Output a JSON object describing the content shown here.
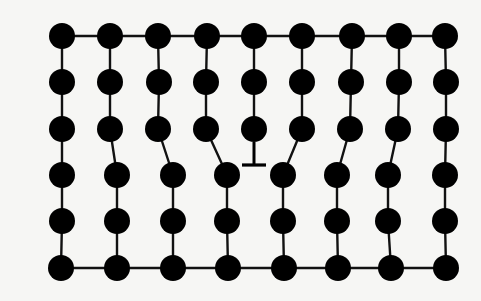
{
  "diagram": {
    "type": "edge-dislocation-lattice",
    "colors": {
      "background": "#f6f6f4",
      "atom": "#000000",
      "bond": "#111111"
    },
    "atom_radius": 13,
    "rows": [
      {
        "y": 36,
        "x": [
          62,
          110,
          158,
          207,
          254,
          302,
          352,
          399,
          445
        ]
      },
      {
        "y": 82,
        "x": [
          62,
          110,
          159,
          206,
          254,
          302,
          351,
          399,
          446
        ]
      },
      {
        "y": 129,
        "x": [
          62,
          110,
          158,
          206,
          254,
          302,
          350,
          398,
          446
        ]
      },
      {
        "y": 175,
        "x": [
          62,
          117,
          173,
          227,
          283,
          337,
          388,
          445
        ]
      },
      {
        "y": 221,
        "x": [
          62,
          117,
          173,
          227,
          283,
          337,
          388,
          445
        ]
      },
      {
        "y": 268,
        "x": [
          61,
          117,
          173,
          228,
          284,
          338,
          391,
          446
        ]
      }
    ],
    "vertical_bonds_upper": [
      [
        0,
        0
      ],
      [
        1,
        1
      ],
      [
        2,
        2
      ],
      [
        3,
        3
      ],
      [
        5,
        4
      ],
      [
        6,
        5
      ],
      [
        7,
        6
      ],
      [
        8,
        7
      ]
    ],
    "dislocation": {
      "symbol": "⊥",
      "x": 254,
      "stem_top": 142,
      "stem_bottom": 165,
      "bar_y": 165,
      "bar_half_width": 12
    }
  }
}
